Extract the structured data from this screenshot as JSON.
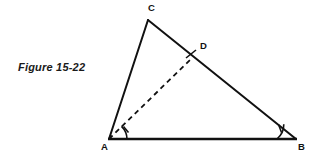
{
  "figure": {
    "caption": "Figure 15-22",
    "caption_color": "#1a1a1a",
    "background_color": "#ffffff",
    "stroke_color": "#111111",
    "labels": {
      "c": "C",
      "d": "D",
      "a": "A",
      "b": "B"
    },
    "geometry": {
      "type": "triangle-with-cevian",
      "points": {
        "A": [
          109,
          139
        ],
        "B": [
          296,
          139
        ],
        "C": [
          148,
          20
        ],
        "D": [
          192,
          58
        ]
      },
      "solid_segments": [
        {
          "name": "side-ac",
          "from": "A",
          "to": "C"
        },
        {
          "name": "side-cb",
          "from": "C",
          "to": "B"
        },
        {
          "name": "side-ab",
          "from": "A",
          "to": "B"
        }
      ],
      "dashed_segments": [
        {
          "name": "cevian-ad",
          "from": "A",
          "to": "D"
        }
      ],
      "angle_marks": [
        {
          "name": "angle-dab",
          "vertex": "A",
          "ticks": 1
        },
        {
          "name": "angle-abd",
          "vertex": "B",
          "ticks": 1
        }
      ],
      "point_ticks": [
        {
          "name": "tick-at-d",
          "at": "D"
        }
      ]
    }
  }
}
